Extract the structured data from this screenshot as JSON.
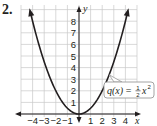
{
  "problem": {
    "number": "2."
  },
  "chart_data": {
    "type": "line",
    "title": "",
    "xlabel": "x",
    "ylabel": "y",
    "xlim": [
      -5,
      5
    ],
    "ylim": [
      0,
      9
    ],
    "grid": true,
    "x_ticks": [
      "-4",
      "-3",
      "-2",
      "-1",
      "1",
      "2",
      "3",
      "4"
    ],
    "y_ticks": [
      "1",
      "2",
      "3",
      "4",
      "5",
      "6",
      "7",
      "8"
    ],
    "series": [
      {
        "name": "q(x) = 1/2 x^2",
        "function": "0.5*x^2",
        "x": [
          -4.2,
          -4,
          -3,
          -2,
          -1,
          0,
          1,
          2,
          3,
          4,
          4.2
        ],
        "values": [
          8.82,
          8,
          4.5,
          2,
          0.5,
          0,
          0.5,
          2,
          4.5,
          8,
          8.82
        ]
      }
    ],
    "annotation": {
      "text_func": "q(x) = ",
      "num": "1",
      "den": "2",
      "var": "x",
      "exp": "2",
      "points_to": [
        2.6,
        3.38
      ]
    }
  }
}
